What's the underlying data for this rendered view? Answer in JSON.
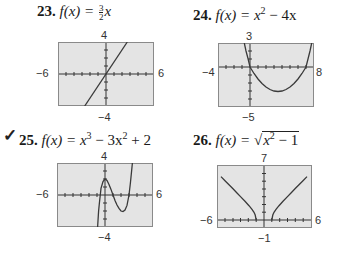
{
  "problems": [
    {
      "number": "23.",
      "checked": false,
      "function_label": "f(x) = ",
      "expression": "(3/2)x",
      "expression_parts": {
        "frac_num": "3",
        "frac_den": "2",
        "var": "x"
      },
      "window": {
        "xmin": "−6",
        "xmax": "6",
        "ymin": "−4",
        "ymax": "4"
      }
    },
    {
      "number": "24.",
      "checked": false,
      "function_label": "f(x) = ",
      "expression": "x² − 4x",
      "expression_parts": {
        "a": "x",
        "a_exp": "2",
        "rest": " − 4x"
      },
      "window": {
        "xmin": "−4",
        "xmax": "8",
        "ymin": "−5",
        "ymax": "3"
      }
    },
    {
      "number": "25.",
      "checked": true,
      "check_mark": "✓",
      "function_label": "f(x) = ",
      "expression": "x³ − 3x² + 2",
      "expression_parts": {
        "a": "x",
        "a_exp": "3",
        "b": " − 3x",
        "b_exp": "2",
        "rest": " + 2"
      },
      "window": {
        "xmin": "−6",
        "xmax": "6",
        "ymin": "−4",
        "ymax": "4"
      }
    },
    {
      "number": "26.",
      "checked": false,
      "function_label": "f(x) = ",
      "expression": "√(x² − 1)",
      "expression_parts": {
        "radical": "√",
        "a": "x",
        "a_exp": "2",
        "rest": " − 1"
      },
      "window": {
        "xmin": "−6",
        "xmax": "6",
        "ymin": "−1",
        "ymax": "7"
      }
    }
  ],
  "colors": {
    "graph_fill": "#e4e4e4",
    "graph_border": "#8a8a8a",
    "axis": "#333333",
    "curve": "#3a3a3a"
  }
}
